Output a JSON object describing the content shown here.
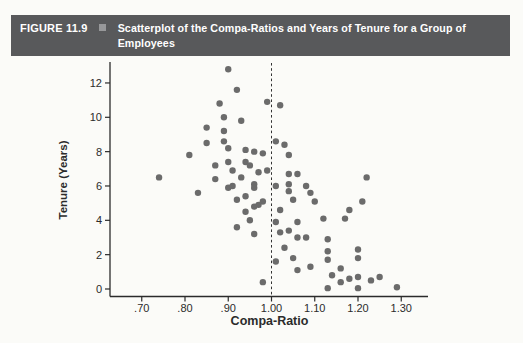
{
  "figure_header": {
    "label": "FIGURE 11.9",
    "bullet_icon": "square-bullet",
    "title": "Scatterplot of the Compa-Ratios and Years of Tenure for a Group of Employees",
    "title_lines": [
      "Scatterplot of the Compa-Ratios and Years of Tenure for a Group of",
      "Employees"
    ]
  },
  "colors": {
    "header_bar": "#58595b",
    "header_text": "#ffffff",
    "bullet": "#97989a",
    "dot": "#6b6b6b",
    "axis": "#2b2b2b",
    "reference_line": "#333333",
    "page_background": "#fbfbf8"
  },
  "chart_data": {
    "type": "scatter",
    "title": "Scatterplot of the Compa-Ratios and Years of Tenure for a Group of Employees",
    "xlabel": "Compa-Ratio",
    "ylabel": "Tenure (Years)",
    "xlim": [
      0.625,
      1.365
    ],
    "ylim": [
      0,
      13.3
    ],
    "grid": false,
    "legend": null,
    "x_ticks": [
      {
        "value": 0.7,
        "label": ".70"
      },
      {
        "value": 0.8,
        "label": ".80"
      },
      {
        "value": 0.9,
        "label": ".90"
      },
      {
        "value": 1.0,
        "label": "1.00"
      },
      {
        "value": 1.1,
        "label": "1.10"
      },
      {
        "value": 1.2,
        "label": "1.20"
      },
      {
        "value": 1.3,
        "label": "1.30"
      }
    ],
    "y_ticks": [
      {
        "value": 0,
        "label": "0"
      },
      {
        "value": 2,
        "label": "2"
      },
      {
        "value": 4,
        "label": "4"
      },
      {
        "value": 6,
        "label": "6"
      },
      {
        "value": 8,
        "label": "8"
      },
      {
        "value": 10,
        "label": "10"
      },
      {
        "value": 12,
        "label": "12"
      }
    ],
    "reference_line": {
      "axis": "x",
      "value": 1.0,
      "style": "dashed"
    },
    "points_format": [
      "compa_ratio",
      "tenure_years"
    ],
    "points": [
      [
        0.9,
        12.8
      ],
      [
        0.92,
        11.6
      ],
      [
        0.88,
        10.8
      ],
      [
        0.99,
        10.9
      ],
      [
        1.02,
        10.7
      ],
      [
        0.89,
        10.0
      ],
      [
        0.93,
        9.8
      ],
      [
        0.85,
        9.4
      ],
      [
        0.89,
        9.2
      ],
      [
        0.89,
        8.6
      ],
      [
        0.85,
        8.5
      ],
      [
        1.01,
        8.6
      ],
      [
        1.03,
        8.4
      ],
      [
        0.9,
        8.2
      ],
      [
        0.94,
        8.1
      ],
      [
        0.96,
        8.0
      ],
      [
        0.98,
        7.9
      ],
      [
        1.04,
        7.8
      ],
      [
        0.81,
        7.8
      ],
      [
        0.9,
        7.4
      ],
      [
        0.94,
        7.4
      ],
      [
        0.95,
        7.2
      ],
      [
        0.87,
        7.2
      ],
      [
        0.91,
        6.9
      ],
      [
        0.97,
        6.8
      ],
      [
        0.99,
        6.9
      ],
      [
        1.04,
        6.7
      ],
      [
        1.06,
        6.7
      ],
      [
        0.74,
        6.5
      ],
      [
        0.87,
        6.4
      ],
      [
        0.93,
        6.5
      ],
      [
        1.22,
        6.5
      ],
      [
        0.96,
        6.1
      ],
      [
        0.96,
        5.9
      ],
      [
        0.9,
        5.9
      ],
      [
        0.91,
        6.0
      ],
      [
        1.01,
        6.0
      ],
      [
        1.04,
        6.1
      ],
      [
        1.04,
        5.7
      ],
      [
        1.08,
        6.0
      ],
      [
        1.09,
        5.6
      ],
      [
        0.83,
        5.6
      ],
      [
        0.92,
        5.2
      ],
      [
        0.94,
        5.4
      ],
      [
        1.05,
        5.2
      ],
      [
        0.98,
        5.1
      ],
      [
        1.1,
        5.1
      ],
      [
        1.21,
        5.1
      ],
      [
        0.97,
        4.9
      ],
      [
        0.96,
        4.8
      ],
      [
        1.02,
        4.6
      ],
      [
        1.18,
        4.6
      ],
      [
        0.94,
        4.5
      ],
      [
        1.12,
        4.1
      ],
      [
        1.17,
        4.1
      ],
      [
        0.95,
        4.0
      ],
      [
        1.01,
        3.9
      ],
      [
        1.06,
        3.9
      ],
      [
        0.92,
        3.6
      ],
      [
        1.02,
        3.3
      ],
      [
        1.04,
        3.4
      ],
      [
        0.96,
        3.2
      ],
      [
        1.06,
        3.0
      ],
      [
        1.08,
        3.0
      ],
      [
        1.13,
        2.9
      ],
      [
        1.03,
        2.4
      ],
      [
        1.13,
        2.2
      ],
      [
        1.2,
        2.3
      ],
      [
        1.05,
        1.8
      ],
      [
        1.2,
        1.8
      ],
      [
        1.13,
        1.7
      ],
      [
        1.01,
        1.6
      ],
      [
        1.16,
        1.2
      ],
      [
        1.09,
        1.3
      ],
      [
        1.06,
        1.1
      ],
      [
        1.14,
        0.8
      ],
      [
        1.2,
        0.7
      ],
      [
        1.25,
        0.7
      ],
      [
        1.18,
        0.6
      ],
      [
        1.23,
        0.5
      ],
      [
        1.16,
        0.4
      ],
      [
        0.98,
        0.4
      ],
      [
        1.29,
        0.1
      ],
      [
        1.13,
        0.05
      ],
      [
        1.2,
        0.05
      ]
    ]
  }
}
